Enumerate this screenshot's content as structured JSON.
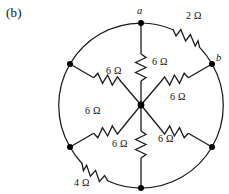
{
  "figure": {
    "part_label": "(b)"
  },
  "nodes": [
    {
      "id": "node-a",
      "label": "a",
      "x": 141,
      "y": 23,
      "has_label": true
    },
    {
      "id": "node-b",
      "label": "b",
      "x": 212,
      "y": 64,
      "has_label": true
    },
    {
      "id": "node-lower-right",
      "label": "",
      "x": 212,
      "y": 147,
      "has_label": false
    },
    {
      "id": "node-bottom",
      "label": "",
      "x": 141,
      "y": 188,
      "has_label": false
    },
    {
      "id": "node-lower-left",
      "label": "",
      "x": 70,
      "y": 147,
      "has_label": false
    },
    {
      "id": "node-upper-left",
      "label": "",
      "x": 70,
      "y": 64,
      "has_label": false
    }
  ],
  "hub": {
    "x": 141,
    "y": 105
  },
  "circle": {
    "cx": 141,
    "cy": 105,
    "r": 82
  },
  "spoke_resistors": [
    {
      "id": "spoke-a",
      "value": "6 Ω",
      "label_x": 152,
      "label_y": 57
    },
    {
      "id": "spoke-b",
      "value": "6 Ω",
      "label_x": 177,
      "label_y": 94
    },
    {
      "id": "spoke-lower-right",
      "value": "6 Ω",
      "label_x": 168,
      "label_y": 142
    },
    {
      "id": "spoke-bottom",
      "value": "6 Ω",
      "label_x": 112,
      "label_y": 146
    },
    {
      "id": "spoke-lower-left",
      "value": "6 Ω",
      "label_x": 88,
      "label_y": 113
    },
    {
      "id": "spoke-upper-left",
      "value": "6 Ω",
      "label_x": 108,
      "label_y": 72
    }
  ],
  "arc_resistors": [
    {
      "id": "arc-a-b",
      "value": "2 Ω",
      "label_x": 186,
      "label_y": 17
    },
    {
      "id": "arc-lower-left-bottom",
      "value": "4 Ω",
      "label_x": 78,
      "label_y": 180
    }
  ],
  "style": {
    "stroke": "#1a1a1a",
    "background": "#ffffff",
    "node_fill": "#000000"
  }
}
